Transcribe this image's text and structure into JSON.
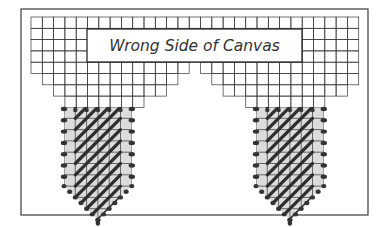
{
  "diagram": {
    "title": "Wrong Side of Canvas",
    "colors": {
      "frame": "#4a4a4a",
      "grid": "#3a3a3a",
      "stitch_fill": "#dcdcdc",
      "stitch": "#2e2e2e"
    },
    "frame": {
      "x": 21,
      "y": 9,
      "w": 347,
      "h": 206
    },
    "grid": {
      "origin_x": 31,
      "origin_y": 17,
      "cell": 11.3,
      "rows": [
        {
          "spans": [
            [
              0,
              29
            ]
          ]
        },
        {
          "spans": [
            [
              0,
              29
            ]
          ]
        },
        {
          "spans": [
            [
              0,
              29
            ]
          ]
        },
        {
          "spans": [
            [
              0,
              29
            ]
          ]
        },
        {
          "spans": [
            [
              0,
              14
            ],
            [
              15,
              29
            ]
          ]
        },
        {
          "spans": [
            [
              1,
              13
            ],
            [
              16,
              29
            ]
          ]
        },
        {
          "spans": [
            [
              2,
              12
            ],
            [
              17,
              28
            ]
          ]
        },
        {
          "spans": [
            [
              3,
              10
            ],
            [
              19,
              26
            ]
          ]
        }
      ]
    },
    "label_box": {
      "x": 87,
      "y": 29,
      "w": 215,
      "h": 33
    },
    "stitch_shapes": [
      {
        "name": "left-stitch-area",
        "x": 64,
        "y": 107,
        "cols": 6,
        "rows": 7,
        "point_rows": 3
      },
      {
        "name": "right-stitch-area",
        "x": 256,
        "y": 107,
        "cols": 6,
        "rows": 7,
        "point_rows": 3
      }
    ]
  }
}
